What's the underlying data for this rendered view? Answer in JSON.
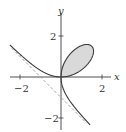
{
  "chart_data": {
    "type": "line",
    "title": "",
    "curve": "Folium of Descartes: x^3 + y^3 = 3xy",
    "xlabel": "x",
    "ylabel": "y",
    "xlim": [
      -2.5,
      2.4
    ],
    "ylim": [
      -2.6,
      3.1
    ],
    "xticks": [
      -2,
      2
    ],
    "xtick_labels": [
      "-2",
      "2"
    ],
    "yticks": [
      -2,
      2
    ],
    "ytick_labels": [
      "-2",
      "2"
    ],
    "grid": false,
    "legend": null,
    "series": [
      {
        "name": "folium",
        "style": "solid",
        "color": "#3a3a3a",
        "param": "x = 3t/(1+t^3), y = 3t^2/(1+t^3)",
        "loop_filled": true,
        "loop_fill_color": "#d9d9d9",
        "sample_points": [
          [
            -2.5,
            2.0
          ],
          [
            -1.5,
            0.95
          ],
          [
            -1,
            0.5
          ],
          [
            0,
            0
          ],
          [
            0.75,
            1.5
          ],
          [
            1.26,
            1.59
          ],
          [
            1.5,
            1.5
          ],
          [
            1.59,
            1.26
          ],
          [
            1.5,
            0.75
          ],
          [
            0.5,
            -1
          ],
          [
            0,
            -1.5
          ],
          [
            1.55,
            -2.5
          ]
        ]
      },
      {
        "name": "asymptote",
        "style": "dashed",
        "color": "#9a9a9a",
        "equation": "x + y + 1 = 0",
        "points": [
          [
            -2.4,
            1.4
          ],
          [
            1.25,
            -2.25
          ]
        ]
      }
    ]
  },
  "axes": {
    "x_label": "x",
    "y_label": "y",
    "tick_neg2": "−2",
    "tick_pos2": "2"
  }
}
